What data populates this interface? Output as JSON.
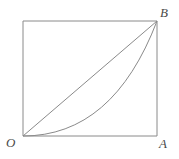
{
  "figure": {
    "type": "geometry-diagram",
    "background_color": "#ffffff",
    "stroke_color": "#8a8a8a",
    "label_color": "#4a4a4a",
    "stroke_width": 1,
    "canvas": {
      "width": 179,
      "height": 159
    },
    "rectangle": {
      "left": 23,
      "top": 21,
      "right": 157,
      "bottom": 136,
      "path": "M 23 21 L 157 21 L 157 136 L 23 136 Z"
    },
    "diagonal": {
      "name": "chord-OB",
      "from": "O",
      "to": "B",
      "path": "M 23 136 L 157 21"
    },
    "curve": {
      "name": "parabolic-arc-OB",
      "from": "O",
      "to": "B",
      "shape": "parabola",
      "equation": "y = x^2",
      "path": "M 23 136 Q 113 136 157 21"
    },
    "labels": [
      {
        "id": "O",
        "text": "O",
        "position": "bottom-left",
        "x": 6,
        "y": 136
      },
      {
        "id": "A",
        "text": "A",
        "position": "bottom-right",
        "x": 159,
        "y": 137
      },
      {
        "id": "B",
        "text": "B",
        "position": "top-right",
        "x": 160,
        "y": 6
      }
    ]
  }
}
